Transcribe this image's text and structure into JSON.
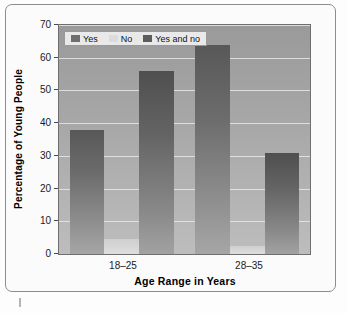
{
  "chart_data": {
    "type": "bar",
    "title": "",
    "subtitle": "",
    "xlabel": "Age Range in Years",
    "ylabel": "Percentage of Young People",
    "categories": [
      "18–25",
      "28–35"
    ],
    "series": [
      {
        "name": "Yes",
        "values": [
          38,
          64
        ]
      },
      {
        "name": "No",
        "values": [
          4.5,
          2.5
        ]
      },
      {
        "name": "Yes and no",
        "values": [
          56,
          31
        ]
      }
    ],
    "ylim": [
      0,
      70
    ],
    "yticks": [
      0,
      10,
      20,
      30,
      40,
      50,
      60,
      70
    ],
    "ytick_labels": [
      "0",
      "10",
      "20",
      "30",
      "40",
      "50",
      "60",
      "70"
    ],
    "grid": true,
    "grid_axis": "y",
    "legend_position": "upper left",
    "colors": {
      "yes": "#6e6e6e",
      "no": "#dcdcdc",
      "yes_and_no": "#5c5c5c",
      "plot_background": "#a8a8a8",
      "gridline": "#e8e8e8",
      "axis_text": "#1a1a1a",
      "frame_border": "#8d8d8d"
    }
  },
  "legend": {
    "entries": [
      {
        "label": "Yes"
      },
      {
        "label": "No"
      },
      {
        "label": "Yes and no"
      }
    ]
  },
  "axes": {
    "y": {
      "label": "Percentage of Young People",
      "ticks": [
        "70",
        "60",
        "50",
        "40",
        "30",
        "20",
        "10",
        "0"
      ]
    },
    "x": {
      "label": "Age Range in Years",
      "ticks": [
        "18–25",
        "28–35"
      ]
    }
  }
}
